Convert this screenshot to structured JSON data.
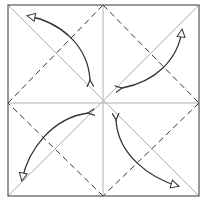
{
  "diagram": {
    "type": "origami-fold-diagram",
    "colors": {
      "background": "#ffffff",
      "border": "#555555",
      "crease": "#aaaaaa",
      "valley_fold": "#333333",
      "arrow": "#333333"
    },
    "square": {
      "x": 8,
      "y": 5,
      "size": 191
    },
    "creases": [
      "horizontal-center",
      "vertical-center",
      "diagonal-tl-br",
      "diagonal-tr-bl"
    ],
    "valley_folds": [
      "diamond-top-left",
      "diamond-top-right",
      "diamond-bottom-left",
      "diamond-bottom-right"
    ],
    "arrows": [
      {
        "name": "fold-top-left-corner",
        "from": "top-left-corner",
        "to": "center"
      },
      {
        "name": "fold-top-right-corner",
        "from": "top-right-corner",
        "to": "center"
      },
      {
        "name": "fold-bottom-left-corner",
        "from": "bottom-left-corner",
        "to": "center"
      },
      {
        "name": "fold-bottom-right-corner",
        "from": "bottom-right-corner",
        "to": "center"
      }
    ]
  }
}
